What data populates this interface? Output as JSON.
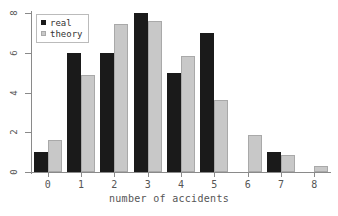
{
  "chart_data": {
    "type": "bar",
    "title": "",
    "xlabel": "number of accidents",
    "ylabel": "",
    "categories": [
      "0",
      "1",
      "2",
      "3",
      "4",
      "5",
      "6",
      "7",
      "8"
    ],
    "series": [
      {
        "name": "real",
        "color": "#1a1a1a",
        "values": [
          1,
          6,
          6,
          8,
          5,
          7,
          0,
          1,
          0
        ]
      },
      {
        "name": "theory",
        "color": "#c8c8c8",
        "values": [
          1.6,
          4.9,
          7.45,
          7.6,
          5.85,
          3.6,
          1.85,
          0.85,
          0.3
        ]
      }
    ],
    "ylim": [
      0,
      8
    ],
    "xlim": [
      -0.5,
      8.5
    ],
    "yticks": [
      "0",
      "2",
      "4",
      "6",
      "8"
    ],
    "ytick_values": [
      0,
      2,
      4,
      6,
      8
    ],
    "grid": false,
    "legend_position": "upper left",
    "legend_entries": [
      "real",
      "theory"
    ]
  }
}
